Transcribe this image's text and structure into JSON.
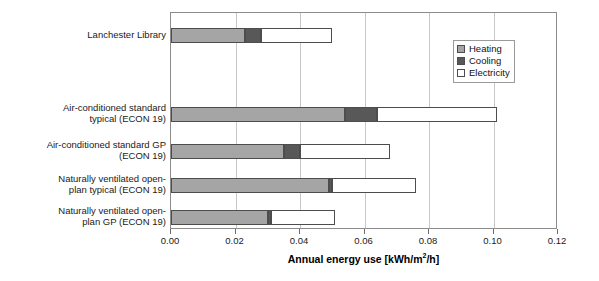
{
  "chart_data": {
    "type": "bar",
    "orientation": "horizontal",
    "stacked": true,
    "title": "",
    "xlabel": "Annual energy use [kWh/m2/h]",
    "xlabel_display": "Annual energy use [kWh/m",
    "xlabel_sup": "2",
    "xlabel_tail": "/h]",
    "ylabel": "",
    "xlim": [
      0.0,
      0.12
    ],
    "xticks": [
      "0.00",
      "0.02",
      "0.04",
      "0.06",
      "0.08",
      "0.10",
      "0.12"
    ],
    "xtick_values": [
      0.0,
      0.02,
      0.04,
      0.06,
      0.08,
      0.1,
      0.12
    ],
    "grid": "vertical",
    "legend_position": "upper right",
    "categories": [
      "Lanchester Library",
      "Air-conditioned standard\ntypical (ECON 19)",
      "Air-conditioned standard GP\n(ECON 19)",
      "Naturally ventilated open-\nplan typical (ECON 19)",
      "Naturally ventilated open-\nplan GP (ECON 19)"
    ],
    "series": [
      {
        "name": "Heating",
        "color": "#a5a5a5",
        "values": [
          0.023,
          0.054,
          0.035,
          0.049,
          0.03
        ]
      },
      {
        "name": "Cooling",
        "color": "#585858",
        "values": [
          0.005,
          0.01,
          0.005,
          0.001,
          0.001
        ]
      },
      {
        "name": "Electricity",
        "color": "#ffffff",
        "values": [
          0.022,
          0.037,
          0.028,
          0.026,
          0.02
        ]
      }
    ],
    "totals": [
      0.05,
      0.101,
      0.068,
      0.076,
      0.051
    ]
  },
  "legend": {
    "items": [
      {
        "label": "Heating"
      },
      {
        "label": "Cooling"
      },
      {
        "label": "Electricity"
      }
    ]
  },
  "axis": {
    "title": "Annual energy use [kWh/m",
    "title_sup": "2",
    "title_tail": "/h]"
  }
}
